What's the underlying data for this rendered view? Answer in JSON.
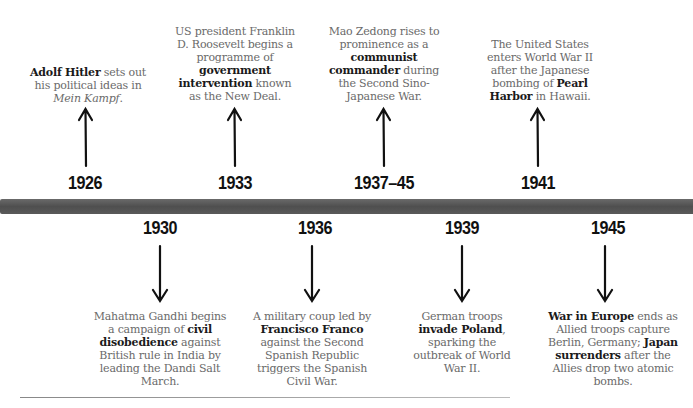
{
  "timeline": {
    "bar_color": "#5a5a5a",
    "top_events": [
      {
        "year": "1926",
        "text_html": "<b>Adolf Hitler</b> sets out his political ideas in <i>Mein Kampf</i>."
      },
      {
        "year": "1933",
        "text_html": "US president Franklin D. Roosevelt begins a programme of <b>government intervention</b> known as the New Deal."
      },
      {
        "year": "1937–45",
        "text_html": "Mao Zedong rises to prominence as a <b>communist commander</b> during the Second Sino-Japanese War."
      },
      {
        "year": "1941",
        "text_html": "The United States enters World War II after the Japanese bombing of <b>Pearl Harbor</b> in Hawaii."
      }
    ],
    "bottom_events": [
      {
        "year": "1930",
        "text_html": "Mahatma Gandhi begins a campaign of <b>civil disobedience</b> against British rule in India by leading the Dandi Salt March."
      },
      {
        "year": "1936",
        "text_html": "A military coup led by <b>Francisco Franco</b> against the Second Spanish Republic triggers the Spanish Civil War."
      },
      {
        "year": "1939",
        "text_html": "German troops <b>invade Poland</b>, sparking the outbreak of World War II."
      },
      {
        "year": "1945",
        "text_html": "<b>War in Europe</b> ends as Allied troops capture Berlin, Germany; <b>Japan surrenders</b> after the Allies drop two atomic bombs."
      }
    ]
  }
}
